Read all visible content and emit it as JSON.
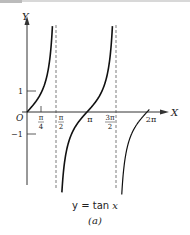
{
  "chart_data": {
    "type": "line",
    "title": "y = tan x",
    "subtitle": "(a)",
    "xlabel": "X",
    "ylabel": "Y",
    "x_ticks": [
      "π/4",
      "π/2",
      "π",
      "3π/2",
      "2π"
    ],
    "y_ticks": [
      "1",
      "-1"
    ],
    "origin_label": "O",
    "asymptotes": [
      "π/2",
      "3π/2"
    ],
    "series": [
      {
        "name": "tan x",
        "function": "tan(x)",
        "x_range": [
          0,
          6.283
        ]
      }
    ],
    "grid": false,
    "legend": "none"
  },
  "labels": {
    "y_axis": "Y",
    "x_axis": "X",
    "origin": "O",
    "one": "1",
    "minus_one": "−1",
    "pi_over_4": [
      "π",
      "4"
    ],
    "pi_over_2": [
      "π",
      "2"
    ],
    "pi": "π",
    "three_pi_over_2": [
      "3π",
      "2"
    ],
    "two_pi": "2π"
  },
  "caption": {
    "equation_prefix": "y = tan ",
    "equation_var": "x",
    "sub": "(a)"
  }
}
